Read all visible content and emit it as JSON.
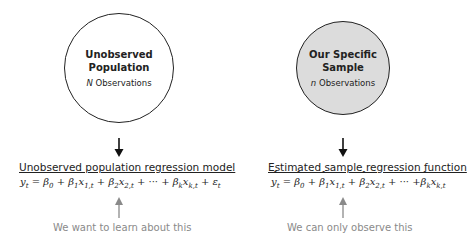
{
  "left": {
    "circle_title_line1": "Unobserved",
    "circle_title_line2": "Population",
    "circle_sub_var": "N",
    "circle_sub_text": " Observations",
    "heading": "Unobserved population regression model",
    "formula": {
      "y": "y",
      "t": "t",
      "eq": " = ",
      "b0": "β",
      "s0": "0",
      "plus": " + ",
      "b1": "β",
      "s1": "1",
      "x1": "x",
      "x1s": "1,t",
      "b2": "β",
      "s2": "2",
      "x2": "x",
      "x2s": "2,t",
      "dots": " + ··· + ",
      "bk": "β",
      "sk": "k",
      "xk": "x",
      "xks": "k,t",
      "eps": "ε",
      "epss": "t"
    },
    "note": "We want to learn about this"
  },
  "right": {
    "circle_title_line1": "Our Specific",
    "circle_title_line2": "Sample",
    "circle_sub_var": "n",
    "circle_sub_text": " Observations",
    "heading": "Estimated sample regression function",
    "formula": {
      "y": "y",
      "t": "t",
      "eq": " = ",
      "b0": "β",
      "s0": "0",
      "plus": " + ",
      "b1": "β",
      "s1": "1",
      "x1": "x",
      "x1s": "1,t",
      "b2": "β",
      "s2": "2",
      "x2": "x",
      "x2s": "2,t",
      "dots": " + ··· +",
      "bk": "β",
      "sk": "k",
      "xk": "x",
      "xks": "k,t"
    },
    "note": "We can only observe this"
  },
  "colors": {
    "sample_fill": "#dcdcdc",
    "note_gray": "#8a8a8a",
    "ink": "#222222"
  }
}
